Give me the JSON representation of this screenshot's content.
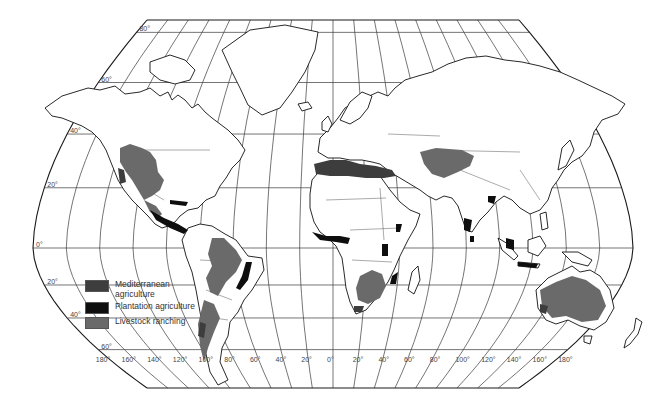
{
  "map": {
    "title": "World agriculture regions",
    "projection": "pseudo-cylindrical",
    "latitude_labels": [
      "80°",
      "60°",
      "40°",
      "20°",
      "0°",
      "20°",
      "40°",
      "60°"
    ],
    "latitude_values": [
      80,
      60,
      40,
      20,
      0,
      -20,
      -40,
      -60
    ],
    "longitude_labels": [
      "180°",
      "160°",
      "140°",
      "120°",
      "100°",
      "80°",
      "60°",
      "40°",
      "20°",
      "0°",
      "20°",
      "40°",
      "60°",
      "80°",
      "100°",
      "120°",
      "140°",
      "160°",
      "180°"
    ],
    "longitude_values": [
      -180,
      -160,
      -140,
      -120,
      -100,
      -80,
      -60,
      -40,
      -20,
      0,
      20,
      40,
      60,
      80,
      100,
      120,
      140,
      160,
      180
    ],
    "colors": {
      "mediterranean": "#3d3d3d",
      "plantation": "#0e0e0e",
      "ranching": "#6a6a6a",
      "land": "#ffffff",
      "outline": "#111111"
    }
  },
  "legend": {
    "items": [
      {
        "key": "mediterranean",
        "label": "Mediterranean agriculture",
        "color": "#3d3d3d"
      },
      {
        "key": "plantation",
        "label": "Plantation agriculture",
        "color": "#0e0e0e"
      },
      {
        "key": "ranching",
        "label": "Livestock ranching",
        "color": "#6a6a6a"
      }
    ]
  },
  "regions": {
    "mediterranean": [
      "California",
      "Central Chile",
      "Mediterranean Basin",
      "Cape region South Africa",
      "Southwestern Australia"
    ],
    "plantation": [
      "Central America coast",
      "Caribbean",
      "Northeast Brazil coast",
      "West Africa coast",
      "East Africa",
      "South Asia",
      "Southeast Asia"
    ],
    "ranching": [
      "Western North America",
      "Mexico",
      "Brazil interior",
      "Argentina",
      "Southern Africa",
      "Central Asia",
      "Australia interior",
      "New Zealand"
    ]
  }
}
